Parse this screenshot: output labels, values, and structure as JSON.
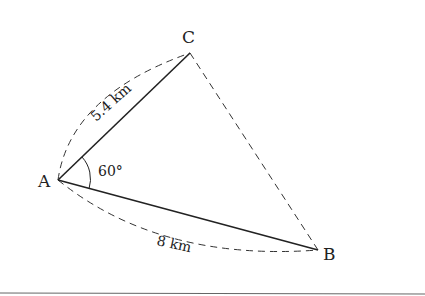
{
  "figure": {
    "type": "triangle-diagram",
    "points": {
      "A": {
        "label": "A",
        "x": 58,
        "y": 180
      },
      "B": {
        "label": "B",
        "x": 318,
        "y": 250
      },
      "C": {
        "label": "C",
        "x": 190,
        "y": 53
      }
    },
    "sides": {
      "AC": {
        "label": "5.4 km",
        "style": "solid",
        "arc_style": "dashed"
      },
      "AB": {
        "label": "8 km",
        "style": "solid",
        "arc_style": "dashed"
      },
      "CB": {
        "label": "",
        "style": "dashed"
      }
    },
    "angle_A": {
      "label": "60°"
    }
  },
  "colors": {
    "stroke": "#222222",
    "background": "#ffffff",
    "rule": "#666666"
  }
}
